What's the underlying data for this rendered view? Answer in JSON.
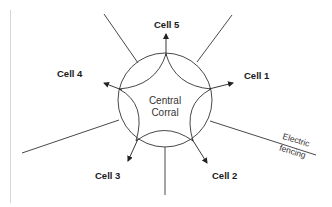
{
  "diagram": {
    "center_label_line1": "Central",
    "center_label_line2": "Corral",
    "cells": [
      {
        "id": "cell-5",
        "label": "Cell 5"
      },
      {
        "id": "cell-1",
        "label": "Cell 1"
      },
      {
        "id": "cell-2",
        "label": "Cell 2"
      },
      {
        "id": "cell-3",
        "label": "Cell 3"
      },
      {
        "id": "cell-4",
        "label": "Cell 4"
      }
    ],
    "fence_label_line1": "Electric",
    "fence_label_line2": "fencing",
    "colors": {
      "stroke": "#333333",
      "text": "#1a1a1a",
      "background": "#ffffff"
    }
  }
}
